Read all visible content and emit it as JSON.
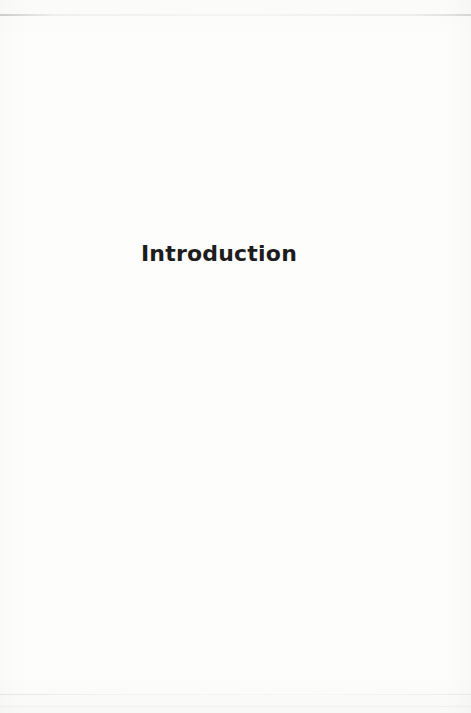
{
  "page": {
    "title": "Introduction"
  },
  "colors": {
    "paper": "#fdfdfc",
    "title_text": "#1e1c1c",
    "scan_edge": "#b4b4b4"
  }
}
